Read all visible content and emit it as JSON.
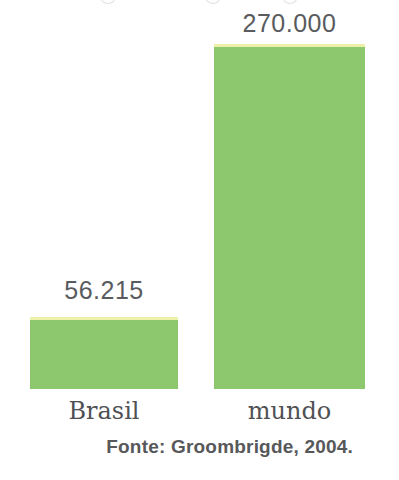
{
  "chart_data": {
    "type": "bar",
    "categories": [
      "Brasil",
      "mundo"
    ],
    "values": [
      56215,
      270000
    ],
    "value_labels": [
      "56.215",
      "270.000"
    ],
    "title": "",
    "xlabel": "",
    "ylabel": "",
    "source": "Fonte: Groombrigde, 2004.",
    "grid": false,
    "axes_hidden": true,
    "legend": "none",
    "layout": {
      "baseline_y_px": 389,
      "max_bar_height_px": 345
    },
    "colors": {
      "bar_fill": "#8dc86e",
      "bar_top_edge": "#edf0a9",
      "value_label": "#595b5e",
      "category_label": "#4f5155",
      "source_text": "#57585a",
      "background": "#ffffff"
    }
  }
}
